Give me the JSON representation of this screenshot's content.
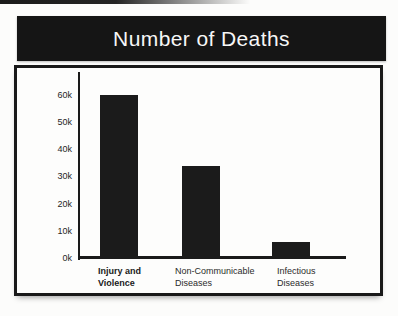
{
  "banner": {
    "background": "#151515",
    "text_color": "#f7f7f7"
  },
  "chart_data": {
    "type": "bar",
    "title": "Number of Deaths",
    "categories": [
      {
        "lines": [
          "Injury and",
          "Violence"
        ],
        "bold": true
      },
      {
        "lines": [
          "Non-Communicable",
          "Diseases"
        ],
        "bold": false
      },
      {
        "lines": [
          "Infectious",
          "Diseases"
        ],
        "bold": false
      }
    ],
    "values": [
      60000,
      34000,
      6000
    ],
    "yticks": [
      "0k",
      "10k",
      "20k",
      "30k",
      "40k",
      "50k",
      "60k"
    ],
    "xlabel": "",
    "ylabel": "",
    "ylim": [
      0,
      67000
    ],
    "grid": false,
    "legend": null,
    "bar_color": "#1b1b1b",
    "axis_color": "#1a1a1a"
  }
}
